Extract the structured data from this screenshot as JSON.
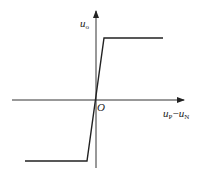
{
  "diagram": {
    "type": "transfer-characteristic",
    "y_axis": {
      "label_main": "u",
      "label_sub": "o"
    },
    "x_axis": {
      "label_main1": "u",
      "label_sub1": "P",
      "minus": "−",
      "label_main2": "u",
      "label_sub2": "N"
    },
    "origin_label": "O",
    "line_color": "#222222"
  }
}
